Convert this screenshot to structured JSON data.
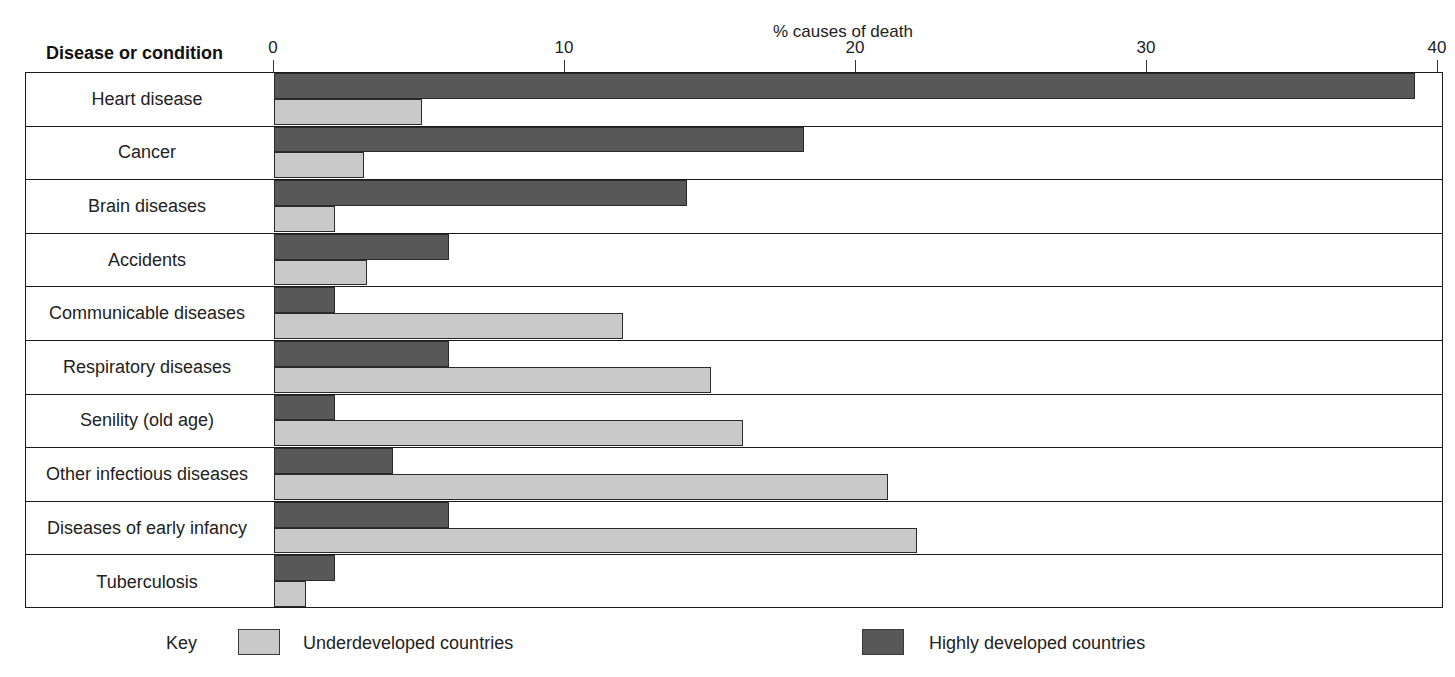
{
  "chart_data": {
    "type": "bar",
    "orientation": "horizontal",
    "grouped": true,
    "title": "% causes of death",
    "xlabel": "% causes of death",
    "ylabel": "Disease or condition",
    "xlim": [
      0,
      40
    ],
    "xticks": [
      0,
      10,
      20,
      30,
      40
    ],
    "xtick_labels": [
      "0",
      "10",
      "20",
      "30",
      "40"
    ],
    "grid": false,
    "legend_position": "bottom",
    "legend_title": "Key",
    "categories": [
      "Heart disease",
      "Cancer",
      "Brain diseases",
      "Accidents",
      "Communicable diseases",
      "Respiratory diseases",
      "Senility (old age)",
      "Other infectious diseases",
      "Diseases of early infancy",
      "Tuberculosis"
    ],
    "series": [
      {
        "name": "Highly developed countries",
        "color": "#585858",
        "values": [
          39.2,
          18.2,
          14.2,
          6.0,
          2.1,
          6.0,
          2.1,
          4.1,
          6.0,
          2.1
        ]
      },
      {
        "name": "Underdeveloped countries",
        "color": "#c9c9c9",
        "values": [
          5.1,
          3.1,
          2.1,
          3.2,
          12.0,
          15.0,
          16.1,
          21.1,
          22.1,
          1.1
        ]
      }
    ]
  },
  "axis": {
    "top_title": "% causes of death",
    "category_header": "Disease or condition",
    "tick_labels": [
      "0",
      "10",
      "20",
      "30",
      "40"
    ]
  },
  "legend": {
    "key_label": "Key",
    "entries": [
      {
        "label": "Underdeveloped countries",
        "color": "#c9c9c9"
      },
      {
        "label": "Highly developed countries",
        "color": "#585858"
      }
    ]
  }
}
